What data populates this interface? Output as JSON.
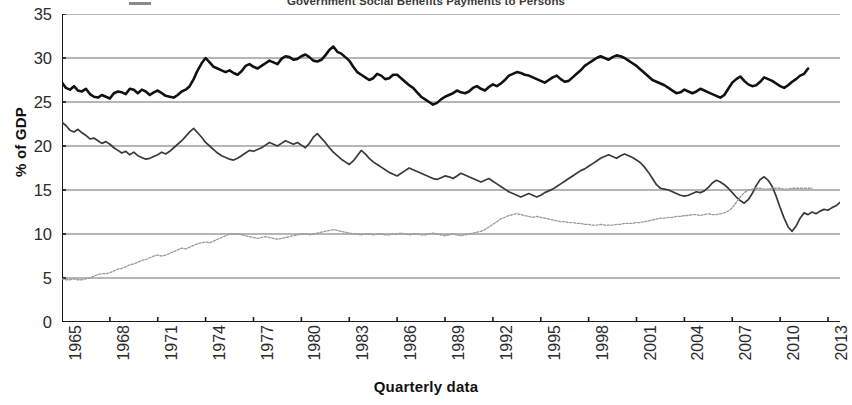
{
  "chart_data": {
    "type": "line",
    "title": "Government Social Benefits Payments to Persons",
    "xlabel": "Quarterly data",
    "ylabel": "% of GDP",
    "ylim": [
      0,
      35
    ],
    "yticks": [
      0,
      5,
      10,
      15,
      20,
      25,
      30,
      35
    ],
    "xlim": [
      1965,
      2013.75
    ],
    "xticks": [
      1965,
      1968,
      1971,
      1974,
      1977,
      1980,
      1983,
      1986,
      1989,
      1992,
      1995,
      1998,
      2001,
      2004,
      2007,
      2010,
      2013
    ],
    "grid": "horizontal",
    "legend": "none-visible",
    "x_start": 1965,
    "x_step": 0.25,
    "series": [
      {
        "name": "Total Government Expenditures",
        "color": "#111111",
        "width": 2.6,
        "style": "solid",
        "values": [
          27.2,
          26.6,
          26.4,
          26.8,
          26.3,
          26.2,
          26.5,
          25.9,
          25.6,
          25.5,
          25.8,
          25.6,
          25.4,
          26.0,
          26.2,
          26.1,
          25.9,
          26.5,
          26.4,
          26.0,
          26.4,
          26.2,
          25.8,
          26.1,
          26.3,
          26.0,
          25.7,
          25.6,
          25.5,
          25.8,
          26.2,
          26.4,
          26.8,
          27.6,
          28.6,
          29.4,
          30.0,
          29.5,
          29.0,
          28.8,
          28.6,
          28.4,
          28.6,
          28.3,
          28.1,
          28.5,
          29.1,
          29.3,
          29.0,
          28.8,
          29.1,
          29.4,
          29.7,
          29.5,
          29.3,
          29.9,
          30.2,
          30.1,
          29.8,
          29.9,
          30.2,
          30.4,
          30.1,
          29.7,
          29.6,
          29.8,
          30.3,
          30.9,
          31.3,
          30.7,
          30.5,
          30.1,
          29.7,
          29.0,
          28.4,
          28.1,
          27.8,
          27.5,
          27.7,
          28.2,
          28.0,
          27.6,
          27.7,
          28.1,
          28.1,
          27.7,
          27.3,
          26.9,
          26.6,
          26.1,
          25.6,
          25.3,
          25.0,
          24.7,
          24.9,
          25.3,
          25.6,
          25.8,
          26.0,
          26.3,
          26.1,
          26.0,
          26.2,
          26.6,
          26.8,
          26.5,
          26.3,
          26.7,
          27.0,
          26.8,
          27.1,
          27.5,
          28.0,
          28.2,
          28.4,
          28.3,
          28.1,
          28.0,
          27.8,
          27.6,
          27.4,
          27.2,
          27.5,
          27.8,
          28.0,
          27.6,
          27.3,
          27.4,
          27.8,
          28.2,
          28.6,
          29.1,
          29.4,
          29.7,
          30.0,
          30.2,
          30.0,
          29.8,
          30.1,
          30.3,
          30.2,
          30.0,
          29.7,
          29.4,
          29.1,
          28.7,
          28.3,
          27.9,
          27.5,
          27.3,
          27.1,
          26.9,
          26.6,
          26.3,
          26.0,
          26.1,
          26.4,
          26.2,
          26.0,
          26.2,
          26.5,
          26.3,
          26.1,
          25.9,
          25.7,
          25.5,
          25.8,
          26.5,
          27.2,
          27.6,
          27.9,
          27.4,
          27.0,
          26.8,
          26.9,
          27.3,
          27.8,
          27.6,
          27.4,
          27.1,
          26.8,
          26.6,
          26.9,
          27.3,
          27.6,
          28.0,
          28.2,
          28.8
        ]
      },
      {
        "name": "Government Purchases of Goods and Services",
        "color": "#3a3a3a",
        "width": 1.7,
        "style": "solid",
        "values": [
          22.7,
          22.3,
          21.8,
          21.6,
          21.9,
          21.5,
          21.2,
          20.8,
          20.9,
          20.6,
          20.3,
          20.5,
          20.2,
          19.8,
          19.5,
          19.2,
          19.4,
          19.0,
          19.3,
          18.9,
          18.7,
          18.5,
          18.6,
          18.8,
          19.0,
          19.3,
          19.1,
          19.4,
          19.8,
          20.2,
          20.6,
          21.1,
          21.6,
          22.0,
          21.5,
          21.0,
          20.4,
          20.0,
          19.6,
          19.2,
          18.9,
          18.7,
          18.5,
          18.4,
          18.6,
          18.9,
          19.2,
          19.5,
          19.4,
          19.6,
          19.8,
          20.1,
          20.4,
          20.2,
          20.0,
          20.3,
          20.6,
          20.4,
          20.2,
          20.4,
          20.1,
          19.8,
          20.3,
          21.0,
          21.4,
          20.9,
          20.4,
          19.8,
          19.3,
          18.9,
          18.5,
          18.2,
          17.9,
          18.3,
          18.9,
          19.5,
          19.1,
          18.6,
          18.2,
          17.9,
          17.6,
          17.3,
          17.0,
          16.8,
          16.6,
          16.9,
          17.2,
          17.5,
          17.3,
          17.1,
          16.9,
          16.7,
          16.5,
          16.3,
          16.2,
          16.4,
          16.6,
          16.5,
          16.3,
          16.6,
          16.9,
          16.7,
          16.5,
          16.3,
          16.1,
          15.9,
          16.1,
          16.3,
          16.0,
          15.7,
          15.4,
          15.1,
          14.8,
          14.6,
          14.4,
          14.2,
          14.4,
          14.6,
          14.4,
          14.2,
          14.4,
          14.7,
          14.9,
          15.1,
          15.4,
          15.7,
          16.0,
          16.3,
          16.6,
          16.9,
          17.2,
          17.4,
          17.7,
          18.0,
          18.3,
          18.6,
          18.8,
          19.0,
          18.8,
          18.6,
          18.9,
          19.1,
          18.9,
          18.7,
          18.4,
          18.1,
          17.6,
          17.0,
          16.3,
          15.6,
          15.2,
          15.1,
          15.0,
          14.8,
          14.6,
          14.4,
          14.3,
          14.4,
          14.6,
          14.8,
          14.7,
          14.9,
          15.3,
          15.8,
          16.1,
          15.9,
          15.6,
          15.2,
          14.7,
          14.2,
          13.8,
          13.5,
          13.9,
          14.6,
          15.5,
          16.2,
          16.5,
          16.1,
          15.4,
          14.3,
          13.0,
          11.8,
          10.8,
          10.3,
          10.9,
          11.8,
          12.4,
          12.2,
          12.5,
          12.3,
          12.6,
          12.8,
          12.7,
          13.0,
          13.2,
          13.6,
          13.7
        ]
      },
      {
        "name": "Government Social Benefits Payments to Persons",
        "color": "#9a9a9a",
        "width": 1.3,
        "style": "dotted",
        "values": [
          4.9,
          4.8,
          4.8,
          4.9,
          4.8,
          4.8,
          4.9,
          5.0,
          5.2,
          5.4,
          5.5,
          5.5,
          5.6,
          5.8,
          6.0,
          6.1,
          6.3,
          6.5,
          6.6,
          6.8,
          7.0,
          7.1,
          7.3,
          7.5,
          7.6,
          7.5,
          7.6,
          7.8,
          8.0,
          8.2,
          8.4,
          8.3,
          8.5,
          8.7,
          8.9,
          9.0,
          9.1,
          9.0,
          9.2,
          9.4,
          9.6,
          9.8,
          10.0,
          10.0,
          10.0,
          9.9,
          9.8,
          9.7,
          9.6,
          9.5,
          9.6,
          9.7,
          9.6,
          9.5,
          9.4,
          9.5,
          9.6,
          9.7,
          9.8,
          9.9,
          10.0,
          10.0,
          9.9,
          10.0,
          10.1,
          10.2,
          10.3,
          10.4,
          10.5,
          10.4,
          10.3,
          10.2,
          10.1,
          10.0,
          10.0,
          9.9,
          10.0,
          10.0,
          9.9,
          10.0,
          10.0,
          9.9,
          9.9,
          10.0,
          10.0,
          10.1,
          10.0,
          9.9,
          10.0,
          10.0,
          9.9,
          9.9,
          10.0,
          10.1,
          10.0,
          9.9,
          9.8,
          9.9,
          10.0,
          9.9,
          9.8,
          9.9,
          10.0,
          10.1,
          10.2,
          10.3,
          10.5,
          10.8,
          11.1,
          11.4,
          11.7,
          11.9,
          12.1,
          12.2,
          12.3,
          12.2,
          12.1,
          12.0,
          11.9,
          12.0,
          11.9,
          11.8,
          11.7,
          11.6,
          11.5,
          11.4,
          11.4,
          11.3,
          11.3,
          11.2,
          11.2,
          11.1,
          11.1,
          11.0,
          11.0,
          11.1,
          11.0,
          11.0,
          11.0,
          11.1,
          11.1,
          11.2,
          11.2,
          11.2,
          11.3,
          11.3,
          11.4,
          11.5,
          11.6,
          11.7,
          11.8,
          11.8,
          11.9,
          11.9,
          12.0,
          12.0,
          12.1,
          12.1,
          12.2,
          12.2,
          12.1,
          12.2,
          12.3,
          12.2,
          12.2,
          12.3,
          12.4,
          12.6,
          13.0,
          13.6,
          14.2,
          14.7,
          15.0,
          15.1,
          15.2,
          15.2,
          15.1,
          15.1,
          15.2,
          15.2,
          15.2,
          15.1,
          15.1,
          15.2,
          15.2,
          15.2,
          15.2,
          15.2,
          15.2
        ]
      }
    ]
  },
  "axis": {
    "y_title": "% of GDP",
    "x_title": "Quarterly data",
    "y_tick_labels": [
      "35",
      "30",
      "25",
      "20",
      "15",
      "10",
      "5",
      "0"
    ],
    "x_tick_labels": [
      "1965",
      "1968",
      "1971",
      "1974",
      "1977",
      "1980",
      "1983",
      "1986",
      "1989",
      "1992",
      "1995",
      "1998",
      "2001",
      "2004",
      "2007",
      "2010",
      "2013"
    ]
  },
  "colors": {
    "gridline": "#6f6f6f",
    "axis": "#1a1a1a",
    "series_1": "#111111",
    "series_2": "#3a3a3a",
    "series_3": "#9a9a9a",
    "background": "#ffffff"
  }
}
